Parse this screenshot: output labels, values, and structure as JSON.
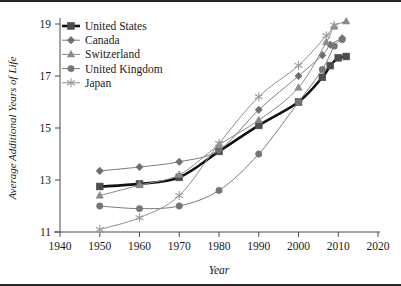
{
  "figure": {
    "frame_color": "#262626",
    "background": "#ffffff"
  },
  "chart_data": {
    "type": "line",
    "title": "",
    "xlabel": "Year",
    "ylabel": "Average Additional Years of Life",
    "xlim": [
      1940,
      2020
    ],
    "ylim": [
      11,
      19
    ],
    "xticks": [
      1940,
      1950,
      1960,
      1970,
      1980,
      1990,
      2000,
      2010,
      2020
    ],
    "yticks": [
      11,
      13,
      15,
      17,
      19
    ],
    "grid": false,
    "legend_position": "top-left",
    "series": [
      {
        "name": "United States",
        "color": "#4d4d4d",
        "line_color": "#111111",
        "line_width": 2.6,
        "marker": "square",
        "x": [
          1950,
          1960,
          1970,
          1980,
          1990,
          2000,
          2006,
          2008,
          2010,
          2012
        ],
        "y": [
          12.75,
          12.85,
          13.1,
          14.1,
          15.1,
          16.0,
          16.95,
          17.4,
          17.7,
          17.75
        ]
      },
      {
        "name": "Canada",
        "color": "#6e6e6e",
        "line_color": "#7a7a7a",
        "line_width": 1.0,
        "marker": "diamond",
        "x": [
          1950,
          1960,
          1970,
          1980,
          1990,
          2000,
          2006,
          2008,
          2011
        ],
        "y": [
          13.35,
          13.5,
          13.7,
          14.15,
          15.7,
          17.0,
          17.8,
          18.2,
          18.45
        ]
      },
      {
        "name": "Switzerland",
        "color": "#8a8a8a",
        "line_color": "#8a8a8a",
        "line_width": 1.0,
        "marker": "triangle",
        "x": [
          1950,
          1960,
          1970,
          1980,
          1990,
          2000,
          2007,
          2009,
          2012
        ],
        "y": [
          12.4,
          12.8,
          13.2,
          14.35,
          15.3,
          16.55,
          18.3,
          18.9,
          19.1
        ]
      },
      {
        "name": "United Kingdom",
        "color": "#757575",
        "line_color": "#7a7a7a",
        "line_width": 1.0,
        "marker": "circle",
        "x": [
          1950,
          1960,
          1970,
          1980,
          1990,
          2000,
          2006,
          2009,
          2011
        ],
        "y": [
          12.0,
          11.9,
          12.0,
          12.6,
          14.0,
          16.0,
          17.25,
          18.15,
          18.4
        ]
      },
      {
        "name": "Japan",
        "color": "#9a9a9a",
        "line_color": "#8f8f8f",
        "line_width": 1.0,
        "marker": "asterisk",
        "x": [
          1950,
          1960,
          1970,
          1980,
          1990,
          2000,
          2007,
          2009
        ],
        "y": [
          11.1,
          11.55,
          12.4,
          14.4,
          16.2,
          17.4,
          18.55,
          18.95
        ]
      }
    ]
  },
  "legend": {
    "items": [
      {
        "label": "United States"
      },
      {
        "label": "Canada"
      },
      {
        "label": "Switzerland"
      },
      {
        "label": "United Kingdom"
      },
      {
        "label": "Japan"
      }
    ]
  }
}
